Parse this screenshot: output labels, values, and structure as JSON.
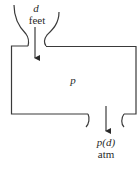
{
  "diagram": {
    "type": "tank-with-inlet-and-outlet",
    "inlet": {
      "variable": "d",
      "unit": "feet"
    },
    "tank": {
      "label": "p"
    },
    "outlet": {
      "variable": "p(d)",
      "unit": "atm"
    },
    "colors": {
      "stroke": "#3a3a3a",
      "text": "#2a2a2a",
      "background": "#ffffff"
    }
  }
}
